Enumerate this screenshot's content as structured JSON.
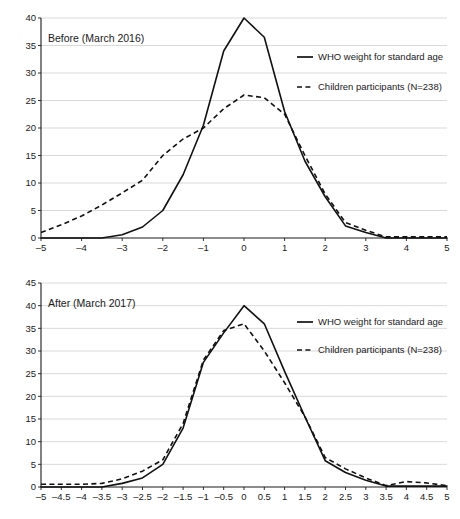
{
  "figure": {
    "background": "#ffffff",
    "line_color": "#111111",
    "grid_color": "#c8c8c8"
  },
  "chart_data": [
    {
      "type": "line",
      "title": "Before (March 2016)",
      "xlabel": "",
      "ylabel": "",
      "xlim": [
        -5,
        5
      ],
      "ylim": [
        0,
        40
      ],
      "grid": true,
      "legend_position": "right",
      "yticks": [
        0,
        5,
        10,
        15,
        20,
        25,
        30,
        35,
        40
      ],
      "ytick_labels": [
        "0",
        "5",
        "10",
        "15",
        "20",
        "25",
        "30",
        "35",
        "40"
      ],
      "xticks": [
        -5,
        -4,
        -3,
        -2,
        -1,
        0,
        1,
        2,
        3,
        4,
        5
      ],
      "xtick_labels": [
        "–5",
        "–4",
        "–3",
        "–2",
        "–1",
        "0",
        "1",
        "2",
        "3",
        "4",
        "5"
      ],
      "x": [
        -5,
        -4.5,
        -4,
        -3.5,
        -3,
        -2.5,
        -2,
        -1.5,
        -1,
        -0.5,
        0,
        0.5,
        1,
        1.5,
        2,
        2.5,
        3,
        3.5,
        4,
        4.5,
        5
      ],
      "series": [
        {
          "name": "WHO weight for standard age",
          "style": "solid",
          "values": [
            0,
            0,
            0,
            0,
            0.6,
            2,
            5,
            11.5,
            20.5,
            34,
            40,
            36.5,
            23,
            14,
            7.5,
            2.2,
            1,
            0,
            0,
            0,
            0
          ]
        },
        {
          "name": "Children participants (N=238)",
          "style": "dashed",
          "values": [
            1,
            2.4,
            4,
            6,
            8.2,
            10.5,
            15,
            18,
            20,
            23.5,
            26,
            25.5,
            22.5,
            15,
            8,
            2.8,
            1.4,
            0.2,
            0.2,
            0.2,
            0.2
          ]
        }
      ]
    },
    {
      "type": "line",
      "title": "After (March 2017)",
      "xlabel": "",
      "ylabel": "",
      "xlim": [
        -5,
        5
      ],
      "ylim": [
        0,
        45
      ],
      "grid": true,
      "legend_position": "right",
      "yticks": [
        0,
        5,
        10,
        15,
        20,
        25,
        30,
        35,
        40,
        45
      ],
      "ytick_labels": [
        "0",
        "5",
        "10",
        "15",
        "20",
        "25",
        "30",
        "35",
        "40",
        "45"
      ],
      "xticks": [
        -5,
        -4.5,
        -4,
        -3.5,
        -3,
        -2.5,
        -2,
        -1.5,
        -1,
        -0.5,
        0,
        0.5,
        1,
        1.5,
        2,
        2.5,
        3,
        3.5,
        4,
        4.5,
        5
      ],
      "xtick_labels": [
        "–5",
        "–4.5",
        "–4",
        "–3.5",
        "–3",
        "–2.5",
        "–2",
        "–1.5",
        "–1",
        "–0.5",
        "0",
        "0.5",
        "1",
        "1.5",
        "2",
        "2.5",
        "3",
        "3.5",
        "4",
        "4.5",
        "5"
      ],
      "x": [
        -5,
        -4.5,
        -4,
        -3.5,
        -3,
        -2.5,
        -2,
        -1.5,
        -1,
        -0.5,
        0,
        0.5,
        1,
        1.5,
        2,
        2.5,
        3,
        3.5,
        4,
        4.5,
        5
      ],
      "series": [
        {
          "name": "WHO weight for standard age",
          "style": "solid",
          "values": [
            0,
            0,
            0,
            0,
            0.8,
            2,
            5,
            13,
            27.5,
            34,
            40,
            36,
            25.5,
            15.5,
            5.8,
            3.2,
            1.5,
            0.2,
            0.2,
            0.2,
            0.2
          ]
        },
        {
          "name": "Children participants (N=238)",
          "style": "dashed",
          "values": [
            0.6,
            0.6,
            0.6,
            0.8,
            1.8,
            3.5,
            6,
            14,
            28,
            34.5,
            36,
            30,
            23,
            15.5,
            6.5,
            4,
            2,
            0.3,
            1.2,
            0.9,
            0.3
          ]
        }
      ]
    }
  ]
}
